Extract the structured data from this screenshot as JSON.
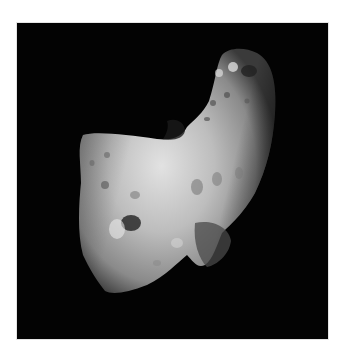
{
  "caption": {
    "text": "一一一一一一一一一一一一一一一"
  },
  "figure": {
    "background_color": "#030303"
  }
}
